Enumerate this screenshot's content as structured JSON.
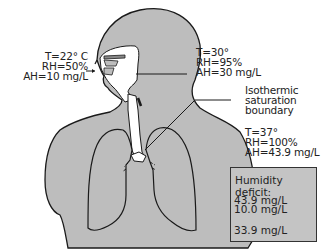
{
  "figure": {
    "colors": {
      "body_fill": "#bdbdbd",
      "outline": "#1a1a1a",
      "airway": "#ffffff",
      "box_fill": "#c4c4c4"
    }
  },
  "labels": {
    "ambient": {
      "t": "T=22° C",
      "rh": "RH=50%",
      "ah": "AH=10 mg/L"
    },
    "pharynx": {
      "t": "T=30°",
      "rh": "RH=95%",
      "ah": "AH=30 mg/L"
    },
    "isothermic": {
      "line1": "Isothermic",
      "line2": "saturation",
      "line3": "boundary"
    },
    "alveolar": {
      "t": "T=37°",
      "rh": "RH=100%",
      "ah": "AH=43.9 mg/L"
    }
  },
  "deficit_box": {
    "title": "Humidity deficit:",
    "value1": "43.9 mg/L",
    "value2": "10.0 mg/L",
    "result": "33.9 mg/L"
  }
}
